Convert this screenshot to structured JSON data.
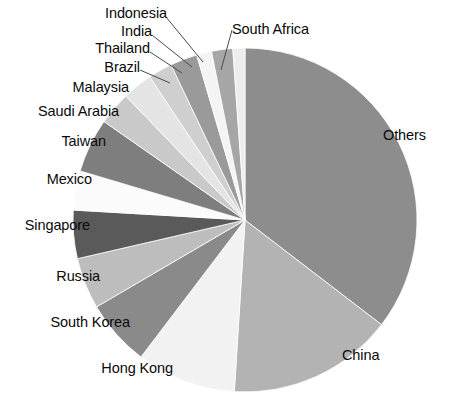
{
  "chart_data": {
    "type": "pie",
    "title": "",
    "subtitle": "",
    "xlabel": "",
    "ylabel": "",
    "legend_position": "none",
    "labels_position": "outside-callout",
    "grid": false,
    "start_angle_deg": 0,
    "direction": "clockwise",
    "categories": [
      "Others",
      "China",
      "Hong Kong",
      "South Korea",
      "Russia",
      "Singapore",
      "Mexico",
      "Taiwan",
      "Saudi Arabia",
      "Malaysia",
      "Brazil",
      "Thailand",
      "India",
      "Indonesia",
      "South Africa"
    ],
    "values": [
      34.7,
      15.3,
      9.2,
      6.1,
      4.7,
      4.4,
      3.6,
      5.0,
      3.1,
      2.8,
      2.2,
      2.5,
      1.4,
      1.9,
      1.1
    ],
    "angles_deg": [
      125.0,
      55.0,
      33.0,
      22.0,
      17.0,
      16.0,
      13.0,
      18.0,
      11.0,
      10.0,
      8.0,
      9.0,
      5.0,
      7.0,
      4.0
    ],
    "colors": [
      "#8d8d8d",
      "#b3b3b3",
      "#f2f2f2",
      "#8a8a8a",
      "#bdbdbd",
      "#5a5a5a",
      "#fbfbfb",
      "#7e7e7e",
      "#c9c9c9",
      "#e4e4e4",
      "#cfcfcf",
      "#9a9a9a",
      "#f4f4f4",
      "#a6a6a6",
      "#ededed"
    ],
    "slices": [
      {
        "label": "Others",
        "value": 34.7,
        "angle_deg": 125.0,
        "color": "#8d8d8d"
      },
      {
        "label": "China",
        "value": 15.3,
        "angle_deg": 55.0,
        "color": "#b3b3b3"
      },
      {
        "label": "Hong Kong",
        "value": 9.2,
        "angle_deg": 33.0,
        "color": "#f2f2f2"
      },
      {
        "label": "South Korea",
        "value": 6.1,
        "angle_deg": 22.0,
        "color": "#8a8a8a"
      },
      {
        "label": "Russia",
        "value": 4.7,
        "angle_deg": 17.0,
        "color": "#bdbdbd"
      },
      {
        "label": "Singapore",
        "value": 4.4,
        "angle_deg": 16.0,
        "color": "#5a5a5a"
      },
      {
        "label": "Mexico",
        "value": 3.6,
        "angle_deg": 13.0,
        "color": "#fbfbfb"
      },
      {
        "label": "Taiwan",
        "value": 5.0,
        "angle_deg": 18.0,
        "color": "#7e7e7e"
      },
      {
        "label": "Saudi Arabia",
        "value": 3.1,
        "angle_deg": 11.0,
        "color": "#c9c9c9"
      },
      {
        "label": "Malaysia",
        "value": 2.8,
        "angle_deg": 10.0,
        "color": "#e4e4e4"
      },
      {
        "label": "Brazil",
        "value": 2.2,
        "angle_deg": 8.0,
        "color": "#cfcfcf"
      },
      {
        "label": "Thailand",
        "value": 2.5,
        "angle_deg": 9.0,
        "color": "#9a9a9a"
      },
      {
        "label": "India",
        "value": 1.4,
        "angle_deg": 5.0,
        "color": "#f4f4f4"
      },
      {
        "label": "Indonesia",
        "value": 1.9,
        "angle_deg": 7.0,
        "color": "#a6a6a6"
      },
      {
        "label": "South Africa",
        "value": 1.1,
        "angle_deg": 4.0,
        "color": "#ededed"
      }
    ]
  },
  "labels": {
    "others": "Others",
    "china": "China",
    "hong_kong": "Hong Kong",
    "south_korea": "South Korea",
    "russia": "Russia",
    "singapore": "Singapore",
    "mexico": "Mexico",
    "taiwan": "Taiwan",
    "saudi_arabia": "Saudi Arabia",
    "malaysia": "Malaysia",
    "brazil": "Brazil",
    "thailand": "Thailand",
    "india": "India",
    "indonesia": "Indonesia",
    "south_africa": "South Africa"
  },
  "style": {
    "background": "#ffffff",
    "text_color": "#0a0a0a",
    "leader_line_color": "#4a4a4a"
  },
  "geometry": {
    "center_x": 245,
    "center_y": 220,
    "radius": 172
  }
}
